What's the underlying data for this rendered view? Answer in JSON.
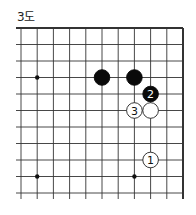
{
  "diagram": {
    "title": "3도",
    "board": {
      "cols": 11,
      "rows": 11,
      "origin_x": 21,
      "origin_y": 28,
      "spacing_x": 16.2,
      "spacing_y": 16.5,
      "edges": {
        "top": true,
        "right": true,
        "left": false,
        "bottom": false
      },
      "line_color": "#333333"
    },
    "star_points": [
      {
        "col": 1,
        "row": 3
      },
      {
        "col": 1,
        "row": 9
      },
      {
        "col": 7,
        "row": 9
      }
    ],
    "stones": [
      {
        "color": "black",
        "col": 5,
        "row": 3,
        "label": ""
      },
      {
        "color": "black",
        "col": 7,
        "row": 3,
        "label": ""
      },
      {
        "color": "black",
        "col": 8,
        "row": 4,
        "label": "2"
      },
      {
        "color": "white",
        "col": 7,
        "row": 5,
        "label": "3"
      },
      {
        "color": "white",
        "col": 8,
        "row": 5,
        "label": ""
      },
      {
        "color": "white",
        "col": 8,
        "row": 8,
        "label": "1"
      }
    ]
  }
}
